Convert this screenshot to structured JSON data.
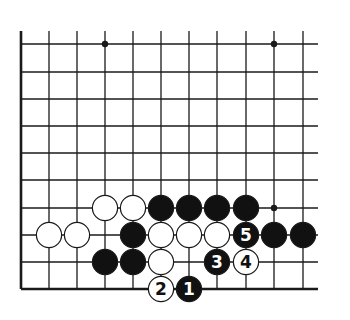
{
  "diagram": {
    "colors": {
      "line": "#1a1a1a",
      "black_stone": "#111111",
      "white_stone": "#ffffff",
      "background": "#ffffff"
    },
    "grid": {
      "columns_x": [
        21,
        49,
        77,
        105,
        133,
        161,
        189,
        217,
        246,
        274,
        303
      ],
      "rows_y": [
        44,
        72,
        99,
        126,
        153,
        180,
        208,
        235,
        262,
        289
      ],
      "right_extent": 318,
      "top_extent": 31,
      "edges": [
        "left",
        "bottom"
      ]
    },
    "star_points": [
      {
        "col": 3,
        "row": 0
      },
      {
        "col": 9,
        "row": 0
      },
      {
        "col": 9,
        "row": 6
      }
    ],
    "stones": [
      {
        "color": "white",
        "col": 3,
        "row": 6,
        "label": ""
      },
      {
        "color": "white",
        "col": 4,
        "row": 6,
        "label": ""
      },
      {
        "color": "black",
        "col": 5,
        "row": 6,
        "label": ""
      },
      {
        "color": "black",
        "col": 6,
        "row": 6,
        "label": ""
      },
      {
        "color": "black",
        "col": 7,
        "row": 6,
        "label": ""
      },
      {
        "color": "black",
        "col": 8,
        "row": 6,
        "label": ""
      },
      {
        "color": "white",
        "col": 1,
        "row": 7,
        "label": ""
      },
      {
        "color": "white",
        "col": 2,
        "row": 7,
        "label": ""
      },
      {
        "color": "black",
        "col": 4,
        "row": 7,
        "label": ""
      },
      {
        "color": "white",
        "col": 5,
        "row": 7,
        "label": ""
      },
      {
        "color": "white",
        "col": 6,
        "row": 7,
        "label": ""
      },
      {
        "color": "white",
        "col": 7,
        "row": 7,
        "label": ""
      },
      {
        "color": "black",
        "col": 8,
        "row": 7,
        "label": "5"
      },
      {
        "color": "black",
        "col": 9,
        "row": 7,
        "label": ""
      },
      {
        "color": "black",
        "col": 10,
        "row": 7,
        "label": ""
      },
      {
        "color": "black",
        "col": 3,
        "row": 8,
        "label": ""
      },
      {
        "color": "black",
        "col": 4,
        "row": 8,
        "label": ""
      },
      {
        "color": "white",
        "col": 5,
        "row": 8,
        "label": ""
      },
      {
        "color": "black",
        "col": 7,
        "row": 8,
        "label": "3"
      },
      {
        "color": "white",
        "col": 8,
        "row": 8,
        "label": "4"
      },
      {
        "color": "white",
        "col": 5,
        "row": 9,
        "label": "2"
      },
      {
        "color": "black",
        "col": 6,
        "row": 9,
        "label": "1"
      }
    ],
    "move_sequence": [
      "1",
      "2",
      "3",
      "4",
      "5"
    ]
  }
}
